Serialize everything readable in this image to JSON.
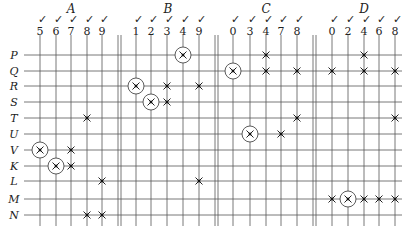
{
  "diagram": {
    "rows": [
      "P",
      "Q",
      "R",
      "S",
      "T",
      "U",
      "V",
      "K",
      "L",
      "M",
      "N"
    ],
    "row_y": [
      55,
      71,
      86,
      102,
      118,
      134,
      150,
      166,
      181,
      199,
      215
    ],
    "grid_left": 24,
    "grid_right": 402,
    "line_top": 35,
    "line_bottom": 226,
    "groups": [
      {
        "name": "A",
        "label_x": 71,
        "columns": [
          {
            "label": "5",
            "x": 40
          },
          {
            "label": "6",
            "x": 56
          },
          {
            "label": "7",
            "x": 71
          },
          {
            "label": "8",
            "x": 87
          },
          {
            "label": "9",
            "x": 102
          }
        ],
        "divider": [
          118,
          121
        ]
      },
      {
        "name": "B",
        "label_x": 168,
        "columns": [
          {
            "label": "1",
            "x": 136
          },
          {
            "label": "2",
            "x": 151
          },
          {
            "label": "3",
            "x": 167
          },
          {
            "label": "4",
            "x": 183
          },
          {
            "label": "9",
            "x": 199
          }
        ],
        "divider": [
          215,
          218
        ]
      },
      {
        "name": "C",
        "label_x": 266,
        "columns": [
          {
            "label": "0",
            "x": 233
          },
          {
            "label": "3",
            "x": 250
          },
          {
            "label": "4",
            "x": 266
          },
          {
            "label": "7",
            "x": 281
          },
          {
            "label": "8",
            "x": 297
          }
        ],
        "divider": [
          313,
          316
        ]
      },
      {
        "name": "D",
        "label_x": 364,
        "columns": [
          {
            "label": "0",
            "x": 332
          },
          {
            "label": "2",
            "x": 348
          },
          {
            "label": "4",
            "x": 364
          },
          {
            "label": "6",
            "x": 379
          },
          {
            "label": "8",
            "x": 395
          }
        ],
        "divider": null
      }
    ],
    "check_mark": "✓",
    "marks": [
      {
        "group": "A",
        "col": "5",
        "row": "V",
        "circled": true
      },
      {
        "group": "A",
        "col": "7",
        "row": "V",
        "circled": false
      },
      {
        "group": "A",
        "col": "6",
        "row": "K",
        "circled": true
      },
      {
        "group": "A",
        "col": "7",
        "row": "K",
        "circled": false
      },
      {
        "group": "A",
        "col": "8",
        "row": "T",
        "circled": false
      },
      {
        "group": "A",
        "col": "9",
        "row": "L",
        "circled": false
      },
      {
        "group": "A",
        "col": "8",
        "row": "N",
        "circled": false
      },
      {
        "group": "A",
        "col": "9",
        "row": "N",
        "circled": false
      },
      {
        "group": "B",
        "col": "4",
        "row": "P",
        "circled": true
      },
      {
        "group": "B",
        "col": "1",
        "row": "R",
        "circled": true
      },
      {
        "group": "B",
        "col": "3",
        "row": "R",
        "circled": false
      },
      {
        "group": "B",
        "col": "9",
        "row": "R",
        "circled": false
      },
      {
        "group": "B",
        "col": "2",
        "row": "S",
        "circled": true
      },
      {
        "group": "B",
        "col": "3",
        "row": "S",
        "circled": false
      },
      {
        "group": "B",
        "col": "9",
        "row": "L",
        "circled": false
      },
      {
        "group": "C",
        "col": "4",
        "row": "P",
        "circled": false
      },
      {
        "group": "C",
        "col": "0",
        "row": "Q",
        "circled": true
      },
      {
        "group": "C",
        "col": "4",
        "row": "Q",
        "circled": false
      },
      {
        "group": "C",
        "col": "8",
        "row": "Q",
        "circled": false
      },
      {
        "group": "C",
        "col": "8",
        "row": "T",
        "circled": false
      },
      {
        "group": "C",
        "col": "3",
        "row": "U",
        "circled": true
      },
      {
        "group": "C",
        "col": "7",
        "row": "U",
        "circled": false
      },
      {
        "group": "D",
        "col": "4",
        "row": "P",
        "circled": false
      },
      {
        "group": "D",
        "col": "0",
        "row": "Q",
        "circled": false
      },
      {
        "group": "D",
        "col": "4",
        "row": "Q",
        "circled": false
      },
      {
        "group": "D",
        "col": "8",
        "row": "Q",
        "circled": false
      },
      {
        "group": "D",
        "col": "8",
        "row": "T",
        "circled": false
      },
      {
        "group": "D",
        "col": "0",
        "row": "M",
        "circled": false
      },
      {
        "group": "D",
        "col": "2",
        "row": "M",
        "circled": true
      },
      {
        "group": "D",
        "col": "4",
        "row": "M",
        "circled": false
      },
      {
        "group": "D",
        "col": "6",
        "row": "M",
        "circled": false
      },
      {
        "group": "D",
        "col": "8",
        "row": "M",
        "circled": false
      }
    ]
  }
}
